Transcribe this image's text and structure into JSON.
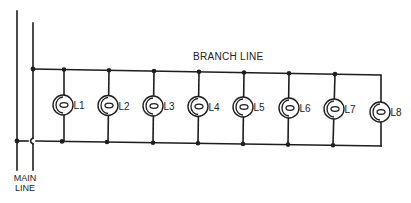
{
  "diagram": {
    "type": "parallel-lighting-circuit",
    "branch_label": "BRANCH LINE",
    "main_label_line1": "MAIN",
    "main_label_line2": "LINE",
    "colors": {
      "ink": "#1e1e1e",
      "background": "#ffffff"
    },
    "lamps": [
      {
        "label": "L1"
      },
      {
        "label": "L2"
      },
      {
        "label": "L3"
      },
      {
        "label": "L4"
      },
      {
        "label": "L5"
      },
      {
        "label": "L6"
      },
      {
        "label": "L7"
      },
      {
        "label": "L8"
      }
    ],
    "lamp_count": 8,
    "icon": "lamp-symbol"
  }
}
